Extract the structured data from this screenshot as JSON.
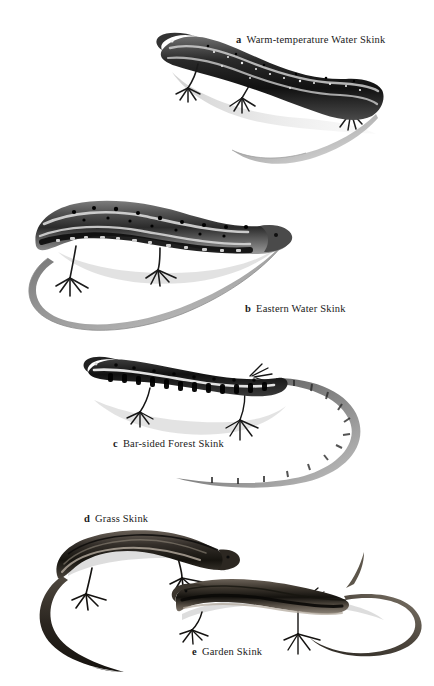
{
  "plate": {
    "title": "Skinks plate",
    "background_color": "#ffffff",
    "width": 434,
    "height": 686,
    "ink_color": "#1a1a1a"
  },
  "figures": [
    {
      "letter": "a",
      "name": "Warm-temperature Water Skink",
      "caption_x": 236,
      "caption_y": 34,
      "facing": "left",
      "pattern": "dark dorsum with pale flecks, pale dorsolateral stripe, long pale tail"
    },
    {
      "letter": "b",
      "name": "Eastern Water Skink",
      "caption_x": 245,
      "caption_y": 303,
      "facing": "right",
      "pattern": "black-blotched flanks, pale dorsolateral stripes, long looping tail"
    },
    {
      "letter": "c",
      "name": "Bar-sided Forest Skink",
      "caption_x": 113,
      "caption_y": 438,
      "facing": "left",
      "pattern": "dark barred flanks, narrow pale dorsolateral stripe, banded looping tail"
    },
    {
      "letter": "d",
      "name": "Grass Skink",
      "caption_x": 84,
      "caption_y": 513,
      "facing": "right",
      "pattern": "bronze-brown dorsum, pale lateral stripe, curved tail"
    },
    {
      "letter": "e",
      "name": "Garden Skink",
      "caption_x": 192,
      "caption_y": 646,
      "facing": "left",
      "pattern": "slender brown body with dark lateral band, upswept tail"
    }
  ]
}
